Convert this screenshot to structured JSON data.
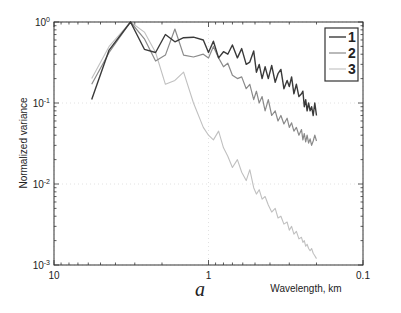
{
  "chart_data": {
    "type": "line",
    "title": "",
    "panel_label": "a",
    "xlabel": "Wavelength, km",
    "ylabel": "Normalized variance",
    "xscale": "log",
    "yscale": "log",
    "x_reversed": true,
    "xlim": [
      10,
      0.1
    ],
    "ylim": [
      0.001,
      1
    ],
    "xticks": [
      {
        "value": 10,
        "label": "10"
      },
      {
        "value": 1,
        "label": "1"
      },
      {
        "value": 0.1,
        "label": "0.1"
      }
    ],
    "yticks": [
      {
        "value": 1,
        "base": "10",
        "exp": "0"
      },
      {
        "value": 0.1,
        "base": "10",
        "exp": "-1"
      },
      {
        "value": 0.01,
        "base": "10",
        "exp": "-2"
      },
      {
        "value": 0.001,
        "base": "10",
        "exp": "-3"
      }
    ],
    "grid": true,
    "legend_position": "upper right",
    "series": [
      {
        "name": "1",
        "color": "#3a3a3a",
        "width": 1.4,
        "x": [
          5.7,
          4.4,
          3.2,
          2.6,
          2.2,
          1.9,
          1.65,
          1.45,
          1.25,
          1.08,
          1.0,
          0.93,
          0.86,
          0.8,
          0.75,
          0.7,
          0.65,
          0.61,
          0.57,
          0.54,
          0.51,
          0.49,
          0.47,
          0.45,
          0.43,
          0.41,
          0.39,
          0.37,
          0.355,
          0.34,
          0.325,
          0.31,
          0.3,
          0.29,
          0.28,
          0.27,
          0.26,
          0.25,
          0.245,
          0.24,
          0.235,
          0.23,
          0.225,
          0.22,
          0.215,
          0.21,
          0.205,
          0.2
        ],
        "y": [
          0.11,
          0.45,
          1.0,
          0.46,
          0.42,
          0.7,
          0.57,
          0.64,
          0.65,
          0.6,
          0.42,
          0.58,
          0.36,
          0.43,
          0.4,
          0.52,
          0.36,
          0.47,
          0.3,
          0.32,
          0.44,
          0.24,
          0.3,
          0.2,
          0.28,
          0.2,
          0.29,
          0.18,
          0.23,
          0.26,
          0.15,
          0.19,
          0.16,
          0.21,
          0.13,
          0.17,
          0.12,
          0.13,
          0.14,
          0.09,
          0.11,
          0.08,
          0.1,
          0.08,
          0.09,
          0.07,
          0.1,
          0.07
        ]
      },
      {
        "name": "2",
        "color": "#8a8a8a",
        "width": 1.2,
        "x": [
          5.7,
          4.4,
          3.2,
          2.6,
          2.2,
          1.9,
          1.65,
          1.45,
          1.25,
          1.08,
          1.0,
          0.93,
          0.86,
          0.8,
          0.75,
          0.7,
          0.65,
          0.61,
          0.57,
          0.54,
          0.51,
          0.49,
          0.47,
          0.45,
          0.43,
          0.41,
          0.39,
          0.37,
          0.355,
          0.34,
          0.325,
          0.31,
          0.3,
          0.29,
          0.28,
          0.27,
          0.26,
          0.25,
          0.245,
          0.24,
          0.235,
          0.23,
          0.225,
          0.22,
          0.215,
          0.21,
          0.205,
          0.2
        ],
        "y": [
          0.17,
          0.42,
          1.0,
          0.62,
          0.33,
          0.39,
          0.82,
          0.39,
          0.37,
          0.4,
          0.36,
          0.5,
          0.36,
          0.28,
          0.31,
          0.22,
          0.2,
          0.21,
          0.15,
          0.17,
          0.11,
          0.14,
          0.1,
          0.12,
          0.08,
          0.11,
          0.07,
          0.08,
          0.06,
          0.07,
          0.055,
          0.065,
          0.05,
          0.057,
          0.045,
          0.05,
          0.04,
          0.047,
          0.035,
          0.042,
          0.033,
          0.04,
          0.032,
          0.036,
          0.03,
          0.034,
          0.04,
          0.034
        ]
      },
      {
        "name": "3",
        "color": "#c0c0c0",
        "width": 1.1,
        "x": [
          5.7,
          4.4,
          3.2,
          2.6,
          2.2,
          1.9,
          1.65,
          1.45,
          1.25,
          1.08,
          1.0,
          0.93,
          0.86,
          0.8,
          0.75,
          0.7,
          0.65,
          0.61,
          0.57,
          0.54,
          0.51,
          0.49,
          0.47,
          0.45,
          0.43,
          0.41,
          0.39,
          0.37,
          0.355,
          0.34,
          0.325,
          0.31,
          0.3,
          0.29,
          0.28,
          0.27,
          0.26,
          0.25,
          0.245,
          0.24,
          0.235,
          0.23,
          0.225,
          0.22,
          0.215,
          0.21,
          0.205,
          0.2
        ],
        "y": [
          0.2,
          0.5,
          1.0,
          0.75,
          0.42,
          0.17,
          0.19,
          0.24,
          0.1,
          0.05,
          0.04,
          0.035,
          0.045,
          0.028,
          0.022,
          0.016,
          0.02,
          0.014,
          0.011,
          0.015,
          0.009,
          0.0075,
          0.0085,
          0.0065,
          0.007,
          0.0055,
          0.0045,
          0.005,
          0.0038,
          0.004,
          0.0032,
          0.0034,
          0.0027,
          0.003,
          0.0024,
          0.0026,
          0.0021,
          0.0022,
          0.0019,
          0.002,
          0.0017,
          0.0018,
          0.0016,
          0.0015,
          0.0016,
          0.0014,
          0.0013,
          0.0012
        ]
      }
    ]
  },
  "layout": {
    "plot_left": 54,
    "plot_right": 363,
    "plot_top": 22,
    "plot_bottom": 265
  }
}
